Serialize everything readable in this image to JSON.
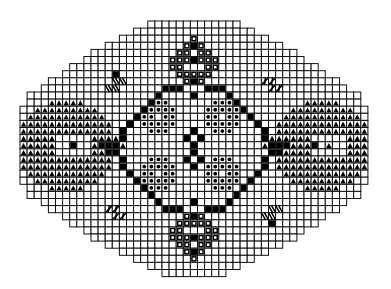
{
  "grid": {
    "origin_x": 20,
    "origin_y": 21,
    "cell": 7.1,
    "cols": 49,
    "rows": 36,
    "line_color": "#111111",
    "background": "#ffffff"
  },
  "row_extents": [
    [
      18,
      30
    ],
    [
      16,
      32
    ],
    [
      14,
      34
    ],
    [
      12,
      36
    ],
    [
      10,
      38
    ],
    [
      9,
      39
    ],
    [
      7,
      41
    ],
    [
      6,
      42
    ],
    [
      4,
      44
    ],
    [
      3,
      45
    ],
    [
      1,
      47
    ],
    [
      1,
      47
    ],
    [
      0,
      48
    ],
    [
      0,
      48
    ],
    [
      0,
      48
    ],
    [
      0,
      48
    ],
    [
      0,
      48
    ],
    [
      0,
      48
    ],
    [
      0,
      48
    ],
    [
      0,
      48
    ],
    [
      0,
      48
    ],
    [
      0,
      48
    ],
    [
      0,
      48
    ],
    [
      1,
      47
    ],
    [
      1,
      47
    ],
    [
      3,
      45
    ],
    [
      4,
      44
    ],
    [
      6,
      42
    ],
    [
      7,
      41
    ],
    [
      9,
      39
    ],
    [
      10,
      38
    ],
    [
      12,
      36
    ],
    [
      14,
      34
    ],
    [
      16,
      32
    ],
    [
      18,
      30
    ],
    [
      20,
      28
    ]
  ],
  "symbols": {
    "filled": {
      "name": "filled-square",
      "color": "#000000"
    },
    "ring": {
      "name": "square-with-hole",
      "color": "#000000"
    },
    "dot": {
      "name": "bobble-dot",
      "color": "#000000"
    },
    "arch": {
      "name": "arch-triangle",
      "color": "#000000"
    },
    "diag": {
      "name": "diagonal-slash",
      "color": "#000000"
    }
  },
  "legend_colors": {
    "ink": "#000000",
    "paper": "#ffffff"
  }
}
